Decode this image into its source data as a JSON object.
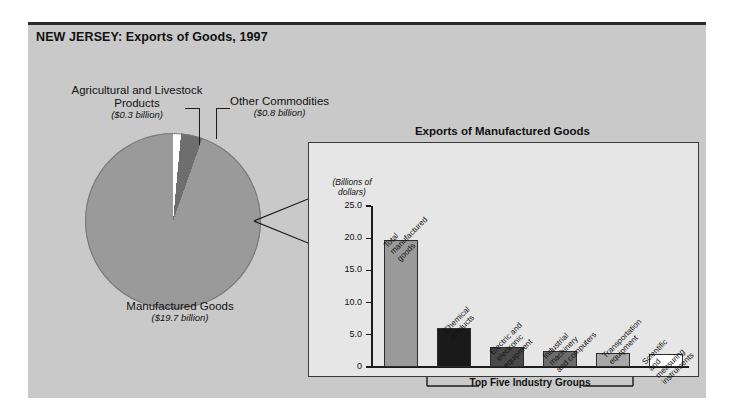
{
  "figure": {
    "title": "NEW JERSEY: Exports of Goods, 1997",
    "panel_color": "#c9c9c9"
  },
  "pie": {
    "labels": {
      "agricultural": {
        "name": "Agricultural and\nLivestock Products",
        "amount": "($0.3 billion)"
      },
      "other": {
        "name": "Other Commodities",
        "amount": "($0.8 billion)"
      },
      "manufactured": {
        "name": "Manufactured\nGoods",
        "amount": "($19.7 billion)"
      }
    }
  },
  "inner_chart": {
    "title": "Exports of Manufactured Goods",
    "axis_unit": "(Billions of\ndollars)",
    "bracket_label": "Top Five Industry Groups"
  },
  "chart_data": [
    {
      "type": "pie",
      "title": "NEW JERSEY: Exports of Goods, 1997",
      "categories": [
        "Manufactured Goods",
        "Other Commodities",
        "Agricultural and Livestock Products"
      ],
      "values": [
        19.7,
        0.8,
        0.3
      ],
      "value_labels": [
        "($19.7 billion)",
        "($0.8 billion)",
        "($0.3 billion)"
      ],
      "colors": [
        "#9a9a9a",
        "#6e6e6e",
        "#ffffff"
      ],
      "units": "Billions of dollars",
      "legend": "none"
    },
    {
      "type": "bar",
      "title": "Exports of Manufactured Goods",
      "categories": [
        "Total\nmanufactured\ngoods",
        "Chemical\nproducts",
        "Electric and\nelectronic\nequipment",
        "Industrial\nmachinery\nand computers",
        "Transportation\nequipment",
        "Scientific and\nmeasuring\ninstruments"
      ],
      "values": [
        19.7,
        6.1,
        3.1,
        2.5,
        2.2,
        2.0
      ],
      "colors": [
        "#9a9a9a",
        "#1a1a1a",
        "#4a4a4a",
        "#6b6b6b",
        "#a8a8a8",
        "#ffffff"
      ],
      "xlabel": "",
      "ylabel": "(Billions of dollars)",
      "ylim": [
        0,
        25
      ],
      "yticks": [
        0,
        5,
        10,
        15,
        20,
        25
      ],
      "ytick_labels": [
        "0",
        "5.0",
        "10.0",
        "15.0",
        "20.0",
        "25.0"
      ],
      "grid": false,
      "legend": "none",
      "annotation": "Top Five Industry Groups"
    }
  ]
}
